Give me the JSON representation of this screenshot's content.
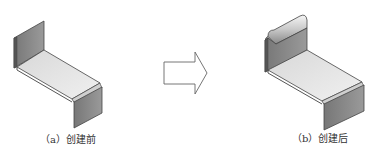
{
  "figure": {
    "panels": [
      {
        "id": "a",
        "caption": "（a）创建前",
        "description": "sheet metal part before feature"
      },
      {
        "id": "b",
        "caption": "（b）创建后",
        "description": "sheet metal part after hem/curl feature"
      }
    ],
    "arrow": {
      "direction": "right",
      "meaning": "transformation"
    },
    "colors": {
      "flange_face": "#8a8a8a",
      "flange_edge": "#555555",
      "top_face": "#e6e6e6",
      "outline": "#444444"
    }
  }
}
